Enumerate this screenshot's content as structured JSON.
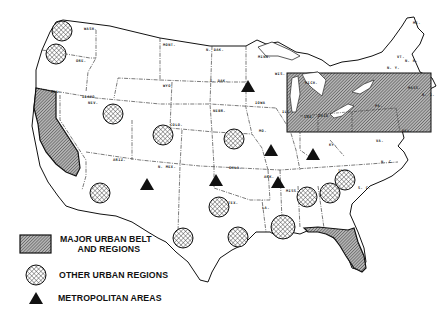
{
  "map": {
    "title": "United States urban regions map",
    "colors": {
      "background": "#ffffff",
      "outline": "#111111",
      "major_belt_fill": "#9a9a9a",
      "hatch": "#222222",
      "triangle": "#111111"
    },
    "state_labels": [
      {
        "text": "WASH.",
        "x": 84,
        "y": 30
      },
      {
        "text": "ORE.",
        "x": 76,
        "y": 62
      },
      {
        "text": "IDAHO",
        "x": 82,
        "y": 98
      },
      {
        "text": "NEV.",
        "x": 88,
        "y": 104
      },
      {
        "text": "CAL.",
        "x": 51,
        "y": 93
      },
      {
        "text": "MONT.",
        "x": 163,
        "y": 46
      },
      {
        "text": "WYO.",
        "x": 163,
        "y": 87
      },
      {
        "text": "N. DAK.",
        "x": 206,
        "y": 51
      },
      {
        "text": "S. DAK.",
        "x": 210,
        "y": 82
      },
      {
        "text": "MINN.",
        "x": 258,
        "y": 58
      },
      {
        "text": "NEBR.",
        "x": 213,
        "y": 112
      },
      {
        "text": "IOWA",
        "x": 255,
        "y": 104
      },
      {
        "text": "WIS.",
        "x": 275,
        "y": 75
      },
      {
        "text": "ILL.",
        "x": 282,
        "y": 113
      },
      {
        "text": "COLO.",
        "x": 170,
        "y": 126
      },
      {
        "text": "UTAH",
        "x": 110,
        "y": 122
      },
      {
        "text": "ARIZ.",
        "x": 113,
        "y": 161
      },
      {
        "text": "N. MEX.",
        "x": 158,
        "y": 168
      },
      {
        "text": "OKLA.",
        "x": 229,
        "y": 169
      },
      {
        "text": "ARK.",
        "x": 264,
        "y": 178
      },
      {
        "text": "MO.",
        "x": 259,
        "y": 132
      },
      {
        "text": "KY.",
        "x": 329,
        "y": 146
      },
      {
        "text": "TENN.",
        "x": 338,
        "y": 172
      },
      {
        "text": "MISS.",
        "x": 286,
        "y": 192
      },
      {
        "text": "LA.",
        "x": 262,
        "y": 209
      },
      {
        "text": "TEX.",
        "x": 228,
        "y": 204
      },
      {
        "text": "S. C.",
        "x": 358,
        "y": 189
      },
      {
        "text": "N. C.",
        "x": 381,
        "y": 163
      },
      {
        "text": "VA.",
        "x": 376,
        "y": 142
      },
      {
        "text": "MICH.",
        "x": 305,
        "y": 84
      },
      {
        "text": "OHIO",
        "x": 318,
        "y": 117
      },
      {
        "text": "IND.",
        "x": 304,
        "y": 118
      },
      {
        "text": "PA.",
        "x": 375,
        "y": 107
      },
      {
        "text": "N. Y.",
        "x": 387,
        "y": 69
      },
      {
        "text": "ME.",
        "x": 413,
        "y": 24
      },
      {
        "text": "VT.",
        "x": 397,
        "y": 58
      },
      {
        "text": "N. H.",
        "x": 405,
        "y": 62
      },
      {
        "text": "MASS.",
        "x": 408,
        "y": 89
      },
      {
        "text": "R. I.",
        "x": 422,
        "y": 96
      },
      {
        "text": "DEL.",
        "x": 402,
        "y": 132
      }
    ],
    "other_urban_regions": [
      {
        "name": "Seattle region",
        "cx": 62,
        "cy": 31,
        "r": 10
      },
      {
        "name": "Portland region",
        "cx": 56,
        "cy": 54,
        "r": 10
      },
      {
        "name": "Salt Lake region",
        "cx": 113,
        "cy": 114,
        "r": 10
      },
      {
        "name": "Denver region",
        "cx": 163,
        "cy": 135,
        "r": 10
      },
      {
        "name": "Kansas City region",
        "cx": 234,
        "cy": 139,
        "r": 10
      },
      {
        "name": "Phoenix region",
        "cx": 100,
        "cy": 193,
        "r": 10
      },
      {
        "name": "Dallas region",
        "cx": 219,
        "cy": 207,
        "r": 10
      },
      {
        "name": "San Antonio region",
        "cx": 183,
        "cy": 238,
        "r": 10
      },
      {
        "name": "Houston region",
        "cx": 238,
        "cy": 237,
        "r": 10
      },
      {
        "name": "New Orleans region",
        "cx": 283,
        "cy": 227,
        "r": 12
      },
      {
        "name": "Birmingham region",
        "cx": 307,
        "cy": 197,
        "r": 10
      },
      {
        "name": "Atlanta region",
        "cx": 330,
        "cy": 193,
        "r": 10
      },
      {
        "name": "Piedmont region",
        "cx": 345,
        "cy": 180,
        "r": 10
      }
    ],
    "metropolitan_areas": [
      {
        "name": "Minneapolis",
        "x": 248,
        "y": 87
      },
      {
        "name": "St. Louis",
        "x": 271,
        "y": 151
      },
      {
        "name": "Louisville",
        "x": 313,
        "y": 155
      },
      {
        "name": "Albuquerque",
        "x": 147,
        "y": 185
      },
      {
        "name": "Oklahoma City",
        "x": 216,
        "y": 181
      },
      {
        "name": "Memphis",
        "x": 278,
        "y": 183
      }
    ],
    "major_urban_belt": {
      "rect": {
        "x": 287,
        "y": 73,
        "w": 144,
        "h": 59
      }
    }
  },
  "legend": {
    "items": [
      {
        "symbol": "hatched-rectangle",
        "label_line1": "MAJOR URBAN BELT",
        "label_line2": "AND REGIONS"
      },
      {
        "symbol": "cross-hatched-circle",
        "label_line1": "OTHER URBAN REGIONS"
      },
      {
        "symbol": "solid-triangle",
        "label_line1": "METROPOLITAN AREAS"
      }
    ]
  }
}
